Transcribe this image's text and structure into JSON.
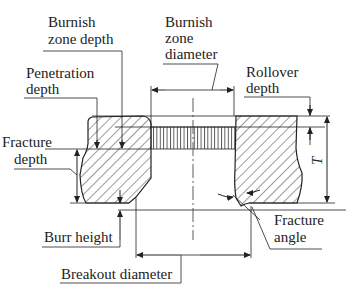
{
  "figure": {
    "labels": {
      "burnish_zone_depth": [
        "Burnish",
        "zone depth"
      ],
      "burnish_zone_diameter": [
        "Burnish",
        "zone",
        "diameter"
      ],
      "penetration_depth": [
        "Penetration",
        "depth"
      ],
      "rollover_depth": [
        "Rollover",
        "depth"
      ],
      "fracture_depth": [
        "Fracture",
        "depth"
      ],
      "burr_height": "Burr height",
      "fracture_angle": [
        "Fracture",
        "angle"
      ],
      "breakout_diameter": "Breakout diameter",
      "thickness": "T"
    }
  },
  "colors": {
    "line": "#222222",
    "background": "#ffffff"
  }
}
